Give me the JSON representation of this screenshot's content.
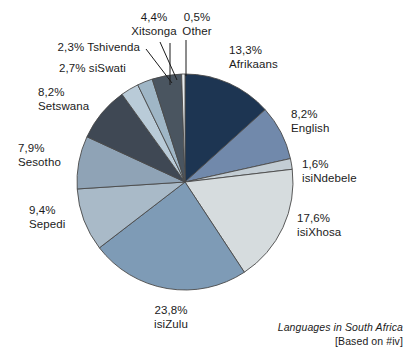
{
  "chart_data": {
    "type": "pie",
    "title": "Languages in South Africa",
    "source_note": "[Based on #iv]",
    "units": "percent",
    "start_angle_deg": 0,
    "direction": "clockwise",
    "center": {
      "x": 185,
      "y": 182
    },
    "radius": 108,
    "categories": [
      "Afrikaans",
      "English",
      "isiNdebele",
      "isiXhosa",
      "isiZulu",
      "Sepedi",
      "Sesotho",
      "Setswana",
      "siSwati",
      "Tshivenda",
      "Xitsonga",
      "Other"
    ],
    "values": [
      13.3,
      8.2,
      1.6,
      17.6,
      23.8,
      9.4,
      7.9,
      8.2,
      2.7,
      2.3,
      4.4,
      0.5
    ],
    "value_labels": [
      "13,3%",
      "8,2%",
      "1,6%",
      "17,6%",
      "23,8%",
      "9,4%",
      "7,9%",
      "8,2%",
      "2,7%",
      "2,3%",
      "4,4%",
      "0,5%"
    ],
    "colors": [
      "#1d3552",
      "#7189ab",
      "#c3cdd4",
      "#d6dcde",
      "#7e9bb6",
      "#a9bac8",
      "#8fa3b6",
      "#3f4854",
      "#b9cbd8",
      "#9fb6c6",
      "#4a5560",
      "#e9edef"
    ],
    "stroke_color": "#4a4a4a",
    "legend_position": "callout-labels",
    "grid": false
  },
  "labels": [
    {
      "id": "xitsonga",
      "pct": "4,4%",
      "name": "Xitsonga"
    },
    {
      "id": "other",
      "pct": "0,5%",
      "name": "Other"
    },
    {
      "id": "tshivenda",
      "pct": "2,3%",
      "name": "Tshivenda"
    },
    {
      "id": "siswati",
      "pct": "2,7%",
      "name": "siSwati"
    },
    {
      "id": "setswana",
      "pct": "8,2%",
      "name": "Setswana"
    },
    {
      "id": "sesotho",
      "pct": "7,9%",
      "name": "Sesotho"
    },
    {
      "id": "sepedi",
      "pct": "9,4%",
      "name": "Sepedi"
    },
    {
      "id": "isizulu",
      "pct": "23,8%",
      "name": "isiZulu"
    },
    {
      "id": "isixhosa",
      "pct": "17,6%",
      "name": "isiXhosa"
    },
    {
      "id": "isindebele",
      "pct": "1,6%",
      "name": "isiNdebele"
    },
    {
      "id": "english",
      "pct": "8,2%",
      "name": "English"
    },
    {
      "id": "afrikaans",
      "pct": "13,3%",
      "name": "Afrikaans"
    }
  ],
  "caption": {
    "title": "Languages in South Africa",
    "source": "[Based on #iv]"
  }
}
